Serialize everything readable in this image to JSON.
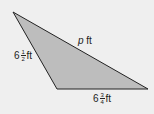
{
  "figure": {
    "shape": "triangle",
    "fill_color": "#bdbdbd",
    "stroke_color": "#222222",
    "background_color": "#efefef",
    "vertices": [
      [
        13,
        12
      ],
      [
        57,
        89
      ],
      [
        148,
        89
      ]
    ],
    "sides": {
      "left": {
        "whole": "6",
        "num": "1",
        "den": "2",
        "unit": "ft"
      },
      "bottom": {
        "whole": "6",
        "num": "3",
        "den": "4",
        "unit": "ft"
      },
      "hypotenuse": {
        "var": "p",
        "unit": "ft"
      }
    }
  }
}
